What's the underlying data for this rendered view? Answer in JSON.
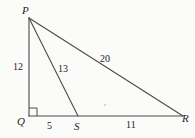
{
  "figure": {
    "kind": "geometry-diagram",
    "shape": "right-triangle-with-cevian",
    "stroke_color": "#3a3a3a",
    "background_color": "#fbfbfa",
    "canvas": {
      "width": 195,
      "height": 138
    },
    "vertices": [
      {
        "id": "P",
        "label": "P",
        "x": 29,
        "y": 18
      },
      {
        "id": "Q",
        "label": "Q",
        "x": 29,
        "y": 116
      },
      {
        "id": "S",
        "label": "S",
        "x": 78,
        "y": 116
      },
      {
        "id": "R",
        "label": "R",
        "x": 183,
        "y": 116
      }
    ],
    "segments": [
      {
        "id": "PQ",
        "from": "P",
        "to": "Q",
        "length_label": "12"
      },
      {
        "id": "PS",
        "from": "P",
        "to": "S",
        "length_label": "13"
      },
      {
        "id": "PR",
        "from": "P",
        "to": "R",
        "length_label": "20"
      },
      {
        "id": "QS",
        "from": "Q",
        "to": "S",
        "length_label": "5"
      },
      {
        "id": "SR",
        "from": "S",
        "to": "R",
        "length_label": "11"
      },
      {
        "id": "QR",
        "from": "Q",
        "to": "R",
        "length_label": ""
      }
    ],
    "right_angle": {
      "at": "Q",
      "size": 8,
      "marker": "square"
    },
    "labels": {
      "vertex_P": "P",
      "vertex_Q": "Q",
      "vertex_S": "S",
      "vertex_R": "R",
      "side_PQ": "12",
      "side_PS": "13",
      "side_PR": "20",
      "side_QS": "5",
      "side_SR": "11"
    }
  }
}
